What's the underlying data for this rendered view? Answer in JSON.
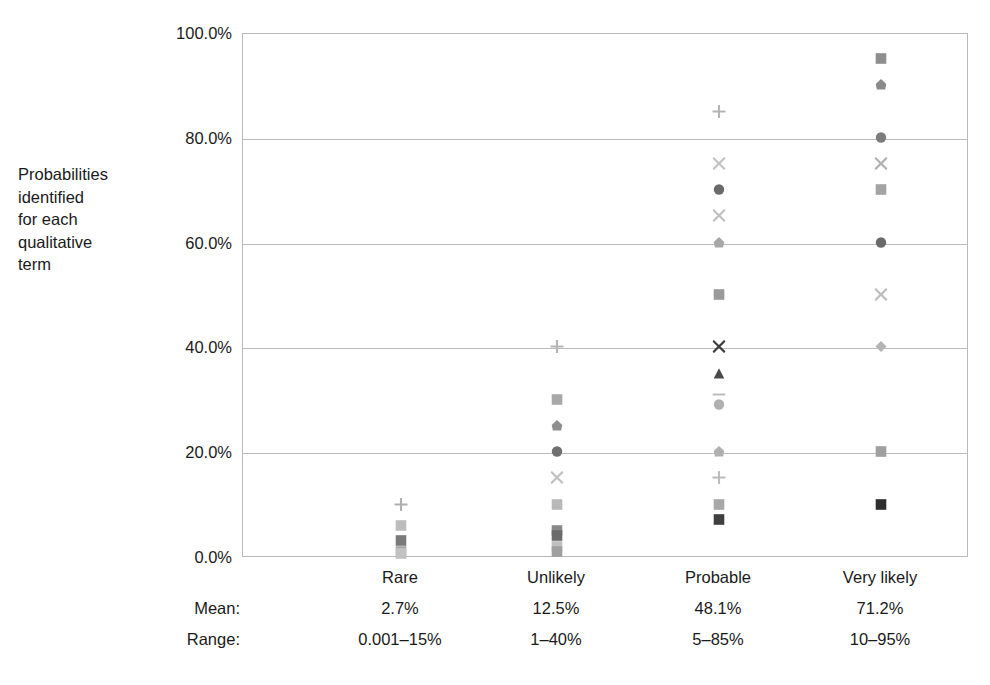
{
  "axis_description": "Probabilities\nidentified\nfor each\nqualitative\nterm",
  "row_labels": {
    "mean": "Mean:",
    "range": "Range:"
  },
  "chart_data": {
    "type": "scatter",
    "title": "",
    "xlabel": "",
    "ylabel": "Probabilities identified for each qualitative term",
    "ylim": [
      0,
      100
    ],
    "grid": true,
    "legend": "none",
    "yticks": [
      "0.0%",
      "20.0%",
      "40.0%",
      "60.0%",
      "80.0%",
      "100.0%"
    ],
    "ytick_values": [
      0,
      20,
      40,
      60,
      80,
      100
    ],
    "categories": [
      "Rare",
      "Unlikely",
      "Probable",
      "Very likely"
    ],
    "category_x": [
      400,
      556,
      718,
      880
    ],
    "summary": {
      "mean": [
        "2.7%",
        "12.5%",
        "48.1%",
        "71.2%"
      ],
      "range": [
        "0.001–15%",
        "1–40%",
        "5–85%",
        "10–95%"
      ]
    },
    "series": [
      {
        "name": "Rare",
        "category_index": 0,
        "points": [
          {
            "value": 10,
            "marker": "plus",
            "color": "#b0b0b0"
          },
          {
            "value": 6,
            "marker": "square",
            "color": "#bdbdbd"
          },
          {
            "value": 3,
            "marker": "square",
            "color": "#7a7a7a"
          },
          {
            "value": 1,
            "marker": "square",
            "color": "#a5a5a5"
          },
          {
            "value": 0.5,
            "marker": "square",
            "color": "#c2c2c2"
          }
        ]
      },
      {
        "name": "Unlikely",
        "category_index": 1,
        "points": [
          {
            "value": 40,
            "marker": "plus",
            "color": "#b5b5b5"
          },
          {
            "value": 30,
            "marker": "square",
            "color": "#a8a8a8"
          },
          {
            "value": 25,
            "marker": "pentagon",
            "color": "#8f8f8f"
          },
          {
            "value": 20,
            "marker": "circle",
            "color": "#6f6f6f"
          },
          {
            "value": 15,
            "marker": "cross",
            "color": "#c0c0c0"
          },
          {
            "value": 10,
            "marker": "square",
            "color": "#b8b8b8"
          },
          {
            "value": 5,
            "marker": "square",
            "color": "#8a8a8a"
          },
          {
            "value": 4,
            "marker": "square",
            "color": "#6b6b6b"
          },
          {
            "value": 2,
            "marker": "square",
            "color": "#c0c0c0"
          },
          {
            "value": 1,
            "marker": "square",
            "color": "#a0a0a0"
          }
        ]
      },
      {
        "name": "Probable",
        "category_index": 2,
        "points": [
          {
            "value": 85,
            "marker": "plus",
            "color": "#b5b5b5"
          },
          {
            "value": 75,
            "marker": "cross",
            "color": "#c2c2c2"
          },
          {
            "value": 70,
            "marker": "circle",
            "color": "#6a6a6a"
          },
          {
            "value": 65,
            "marker": "cross",
            "color": "#c0c0c0"
          },
          {
            "value": 60,
            "marker": "pentagon",
            "color": "#a8a8a8"
          },
          {
            "value": 50,
            "marker": "square",
            "color": "#9a9a9a"
          },
          {
            "value": 40,
            "marker": "cross",
            "color": "#3a3a3a"
          },
          {
            "value": 35,
            "marker": "triangle",
            "color": "#4a4a4a"
          },
          {
            "value": 31,
            "marker": "dash",
            "color": "#bdbdbd"
          },
          {
            "value": 29,
            "marker": "circle",
            "color": "#b0b0b0"
          },
          {
            "value": 20,
            "marker": "pentagon",
            "color": "#b0b0b0"
          },
          {
            "value": 15,
            "marker": "plus",
            "color": "#bcbcbc"
          },
          {
            "value": 10,
            "marker": "square",
            "color": "#a8a8a8"
          },
          {
            "value": 7,
            "marker": "square",
            "color": "#3f3f3f"
          }
        ]
      },
      {
        "name": "Very likely",
        "category_index": 3,
        "points": [
          {
            "value": 95,
            "marker": "square",
            "color": "#8e8e8e"
          },
          {
            "value": 90,
            "marker": "pentagon",
            "color": "#8a8a8a"
          },
          {
            "value": 80,
            "marker": "circle",
            "color": "#7c7c7c"
          },
          {
            "value": 75,
            "marker": "cross",
            "color": "#b0b0b0"
          },
          {
            "value": 70,
            "marker": "square",
            "color": "#a3a3a3"
          },
          {
            "value": 60,
            "marker": "circle",
            "color": "#6a6a6a"
          },
          {
            "value": 50,
            "marker": "cross",
            "color": "#bdbdbd"
          },
          {
            "value": 40,
            "marker": "diamond",
            "color": "#b4b4b4"
          },
          {
            "value": 20,
            "marker": "square",
            "color": "#a0a0a0"
          },
          {
            "value": 10,
            "marker": "square",
            "color": "#2e2e2e"
          }
        ]
      }
    ]
  }
}
